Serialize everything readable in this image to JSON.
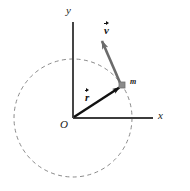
{
  "figure": {
    "axes": {
      "x_label": "x",
      "y_label": "y",
      "origin_label": "O"
    },
    "labels": {
      "mass": "m",
      "velocity_vector": "v",
      "position_vector": "r"
    },
    "colors": {
      "axis": "#3c3c3c",
      "position_vector": "#111111",
      "velocity_vector": "#6b6b6b",
      "circle_dashed": "#8a8a8a",
      "mass_marker": "#7d7d7d",
      "background": "#ffffff"
    },
    "geometry": {
      "origin": {
        "x": 73,
        "y": 118
      },
      "circle_radius": 59,
      "mass_point": {
        "x": 122,
        "y": 85
      },
      "velocity_tip": {
        "x": 99,
        "y": 37
      },
      "y_axis_top": {
        "x": 73,
        "y": 22
      },
      "x_axis_right": {
        "x": 153,
        "y": 118
      }
    }
  }
}
